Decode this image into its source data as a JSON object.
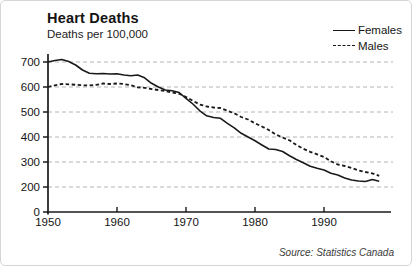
{
  "header": {
    "title": "Heart Deaths",
    "subtitle": "Deaths per 100,000"
  },
  "legend": {
    "items": [
      {
        "label": "Females",
        "style": "solid"
      },
      {
        "label": "Males",
        "style": "dashed"
      }
    ]
  },
  "source": {
    "label": "Source: Statistics Canada"
  },
  "chart_data": {
    "type": "line",
    "title": "Heart Deaths",
    "ylabel": "Deaths per 100,000",
    "xlabel": "",
    "grid": "horizontal dashed",
    "legend_position": "top-right",
    "line_color": "#1a1a1a",
    "grid_color": "#b4b4b4",
    "ylim": [
      0,
      760
    ],
    "y_axis_note": "segment 0-200 is compressed to one gridline step",
    "x_ticks": [
      1950,
      1960,
      1970,
      1980,
      1990
    ],
    "y_ticks": [
      700,
      600,
      500,
      400,
      300,
      200,
      0
    ],
    "x": [
      1950,
      1951,
      1952,
      1953,
      1954,
      1955,
      1956,
      1957,
      1958,
      1959,
      1960,
      1961,
      1962,
      1963,
      1964,
      1965,
      1966,
      1967,
      1968,
      1969,
      1970,
      1971,
      1972,
      1973,
      1974,
      1975,
      1976,
      1977,
      1978,
      1979,
      1980,
      1981,
      1982,
      1983,
      1984,
      1985,
      1986,
      1987,
      1988,
      1989,
      1990,
      1991,
      1992,
      1993,
      1994,
      1995,
      1996,
      1997,
      1998
    ],
    "series": [
      {
        "name": "Females",
        "style": "solid",
        "values": [
          700,
          706,
          710,
          702,
          688,
          668,
          655,
          653,
          654,
          652,
          653,
          648,
          645,
          648,
          637,
          615,
          600,
          588,
          585,
          578,
          555,
          532,
          505,
          485,
          478,
          475,
          455,
          437,
          415,
          400,
          385,
          368,
          352,
          350,
          342,
          325,
          310,
          297,
          283,
          275,
          268,
          255,
          248,
          236,
          228,
          224,
          222,
          230,
          223
        ]
      },
      {
        "name": "Males",
        "style": "dashed",
        "values": [
          600,
          607,
          612,
          611,
          609,
          607,
          606,
          609,
          614,
          612,
          614,
          612,
          607,
          599,
          597,
          592,
          588,
          584,
          578,
          573,
          560,
          545,
          530,
          522,
          518,
          516,
          505,
          495,
          480,
          470,
          455,
          442,
          428,
          410,
          398,
          387,
          368,
          353,
          341,
          331,
          320,
          303,
          290,
          284,
          276,
          266,
          260,
          255,
          245
        ]
      }
    ],
    "source": "Source: Statistics Canada"
  }
}
